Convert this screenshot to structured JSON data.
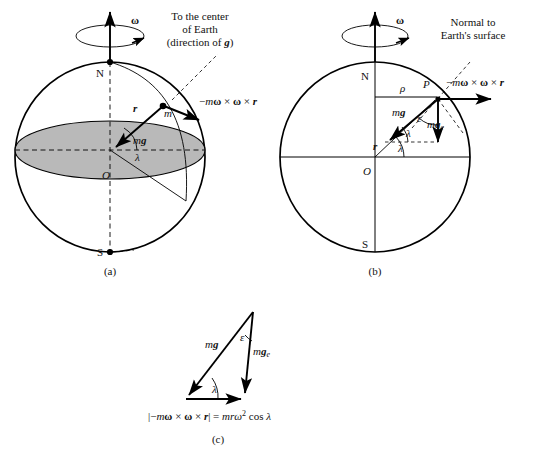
{
  "figure": {
    "title_note": "Effective gravity on a rotating Earth",
    "background_color": "#ffffff",
    "ink_color": "#000000",
    "disk_fill_color": "#b9b9b9"
  },
  "panels": [
    {
      "id": "a",
      "caption": "(a)",
      "annotations": {
        "omega": "ω",
        "north_pole": "N",
        "south_pole": "S",
        "center": "O",
        "mass": "m",
        "r_vector": "r",
        "mg_vector": "mg",
        "lambda": "λ",
        "centrifugal_label": "−mω × ω × r",
        "callout_line1": "To the center",
        "callout_line2": "of Earth",
        "callout_line3": "(direction of g)"
      }
    },
    {
      "id": "b",
      "caption": "(b)",
      "annotations": {
        "omega": "ω",
        "north_pole": "N",
        "south_pole": "S",
        "center": "O",
        "point": "P",
        "rho": "ρ",
        "r_vector": "r",
        "mg_vector": "mg",
        "mge_vector": "mg",
        "mge_subscript": "e",
        "epsilon": "ε",
        "lambda_upper": "λ",
        "lambda_lower": "λ",
        "centrifugal_label": "−mω × ω × r",
        "callout_line1": "Normal to",
        "callout_line2": "Earth's surface"
      }
    },
    {
      "id": "c",
      "caption": "(c)",
      "annotations": {
        "mg_vector": "mg",
        "mge_vector": "mg",
        "mge_subscript": "e",
        "epsilon": "ε",
        "lambda": "λ",
        "equation_lhs": "|−mω × ω × r|",
        "equation_eq": "=",
        "equation_rhs_lead": "mr",
        "equation_rhs_omega": "ω",
        "equation_rhs_exp": "2",
        "equation_rhs_tail": "cos λ"
      }
    }
  ]
}
